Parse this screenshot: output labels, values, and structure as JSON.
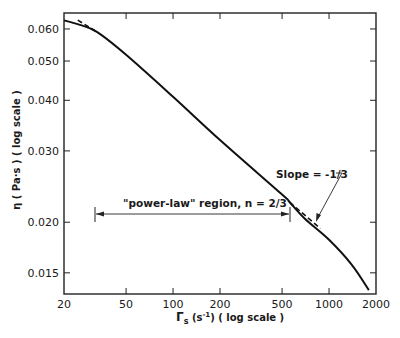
{
  "chart_data": {
    "type": "line",
    "title": "",
    "xlabel": "Γs (s⁻¹) (log scale)",
    "ylabel": "η (Pa·s) (log scale)",
    "xscale": "log",
    "yscale": "log",
    "xlim": [
      20,
      2000
    ],
    "ylim": [
      0.0133,
      0.0657
    ],
    "grid": false,
    "legend": null,
    "x_ticks": [
      20,
      50,
      100,
      200,
      500,
      1000,
      2000
    ],
    "x_tick_labels": [
      "20",
      "50",
      "100",
      "200",
      "500",
      "1000",
      "2000"
    ],
    "y_ticks": [
      0.015,
      0.02,
      0.03,
      0.04,
      0.05,
      0.06
    ],
    "y_tick_labels": [
      "0.015",
      "0.020",
      "0.030",
      "0.040",
      "0.050",
      "0.060"
    ],
    "series": [
      {
        "name": "viscosity curve",
        "style": "solid",
        "x": [
          20,
          25,
          32.5,
          50,
          100,
          200,
          500,
          560,
          700,
          1000,
          1400,
          1800
        ],
        "y": [
          0.063,
          0.0615,
          0.059,
          0.0518,
          0.0408,
          0.0319,
          0.0234,
          0.0224,
          0.0204,
          0.0181,
          0.0157,
          0.0136
        ]
      },
      {
        "name": "low-shear tangent (dashed)",
        "style": "dashed",
        "x": [
          24.5,
          32.5
        ],
        "y": [
          0.0631,
          0.059
        ]
      },
      {
        "name": "slope -1/3 tangent (dashed)",
        "style": "dashed",
        "x": [
          560,
          880
        ],
        "y": [
          0.0224,
          0.0193
        ]
      }
    ],
    "annotations": [
      {
        "text": "\"power-law\" region, n = 2/3",
        "type": "range-bracket",
        "x_from": 31,
        "x_to": 560,
        "y": 0.0213
      },
      {
        "text": "Slope = -1/3",
        "type": "arrow-label",
        "points_to_x": 820,
        "points_to_y": 0.0197
      }
    ]
  },
  "labels": {
    "y_axis": "η ( Pa·s ) ( log scale )",
    "x_axis_main": "Γ",
    "x_axis_sub": "s",
    "x_axis_rest": " (s",
    "x_axis_sup": "-1",
    "x_axis_tail": ") ( log scale )",
    "power_law": "\"power-law\" region, n = 2/3",
    "slope": "Slope = -1/3"
  }
}
